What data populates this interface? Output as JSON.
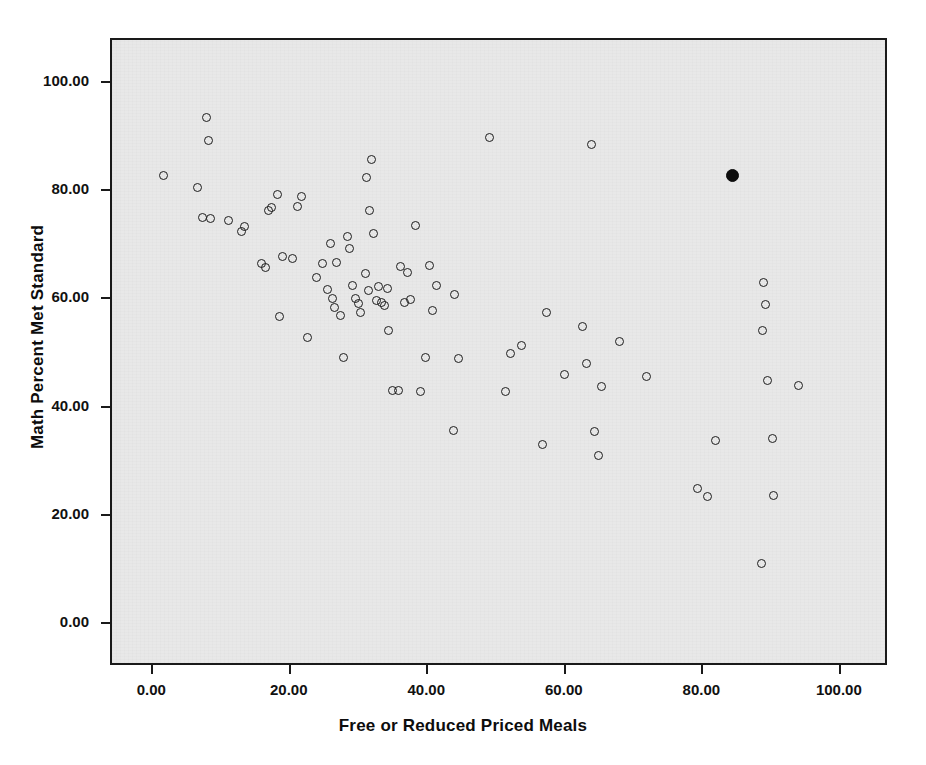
{
  "chart_data": {
    "type": "scatter",
    "title": "",
    "xlabel": "Free or Reduced Priced Meals",
    "ylabel": "Math Percent Met Standard",
    "xlim": [
      -6,
      107
    ],
    "ylim": [
      -8,
      108
    ],
    "xticks": [
      "0.00",
      "20.00",
      "40.00",
      "60.00",
      "80.00",
      "100.00"
    ],
    "xtick_values": [
      0,
      20,
      40,
      60,
      80,
      100
    ],
    "yticks": [
      "0.00",
      "20.00",
      "40.00",
      "60.00",
      "80.00",
      "100.00"
    ],
    "ytick_values": [
      0,
      20,
      40,
      60,
      80,
      100
    ],
    "grid": false,
    "legend": "none",
    "marker_style": "open-circle",
    "highlight_marker_style": "filled-circle",
    "series": [
      {
        "name": "Schools",
        "marker": "open-circle",
        "points": [
          [
            1.5,
            83.0
          ],
          [
            6.5,
            80.8
          ],
          [
            7.8,
            93.7
          ],
          [
            8.0,
            89.4
          ],
          [
            7.2,
            75.1
          ],
          [
            8.3,
            75.0
          ],
          [
            11.0,
            74.6
          ],
          [
            12.8,
            72.6
          ],
          [
            13.2,
            73.5
          ],
          [
            15.8,
            66.7
          ],
          [
            16.3,
            66.0
          ],
          [
            16.8,
            76.4
          ],
          [
            17.2,
            77.0
          ],
          [
            18.0,
            79.4
          ],
          [
            18.3,
            56.9
          ],
          [
            18.8,
            68.0
          ],
          [
            20.2,
            67.5
          ],
          [
            21.0,
            77.2
          ],
          [
            21.6,
            79.0
          ],
          [
            22.4,
            52.9
          ],
          [
            23.8,
            64.0
          ],
          [
            24.6,
            66.6
          ],
          [
            25.4,
            61.9
          ],
          [
            25.8,
            70.4
          ],
          [
            26.0,
            60.1
          ],
          [
            26.6,
            66.8
          ],
          [
            26.4,
            58.5
          ],
          [
            27.2,
            57.1
          ],
          [
            27.6,
            49.2
          ],
          [
            28.3,
            71.6
          ],
          [
            28.6,
            69.5
          ],
          [
            29.0,
            62.6
          ],
          [
            29.4,
            60.1
          ],
          [
            29.8,
            59.2
          ],
          [
            30.2,
            57.6
          ],
          [
            30.8,
            64.8
          ],
          [
            31.3,
            61.6
          ],
          [
            31.0,
            82.6
          ],
          [
            31.8,
            85.8
          ],
          [
            31.4,
            76.4
          ],
          [
            32.0,
            72.2
          ],
          [
            32.4,
            59.8
          ],
          [
            32.8,
            62.4
          ],
          [
            33.2,
            59.5
          ],
          [
            33.6,
            58.8
          ],
          [
            34.0,
            62.0
          ],
          [
            34.2,
            54.2
          ],
          [
            34.8,
            43.2
          ],
          [
            35.6,
            43.1
          ],
          [
            36.0,
            66.1
          ],
          [
            36.6,
            59.5
          ],
          [
            37.0,
            64.9
          ],
          [
            37.4,
            60.0
          ],
          [
            38.2,
            73.6
          ],
          [
            38.8,
            42.9
          ],
          [
            39.6,
            49.3
          ],
          [
            40.2,
            66.3
          ],
          [
            40.6,
            57.9
          ],
          [
            41.2,
            62.6
          ],
          [
            43.6,
            35.7
          ],
          [
            43.8,
            60.9
          ],
          [
            44.4,
            49.1
          ],
          [
            48.9,
            89.9
          ],
          [
            51.2,
            42.9
          ],
          [
            52.0,
            50.0
          ],
          [
            53.6,
            51.4
          ],
          [
            56.6,
            33.2
          ],
          [
            57.2,
            57.6
          ],
          [
            59.8,
            46.2
          ],
          [
            62.4,
            55.0
          ],
          [
            63.0,
            48.1
          ],
          [
            63.8,
            88.6
          ],
          [
            64.2,
            35.6
          ],
          [
            64.8,
            31.2
          ],
          [
            65.2,
            43.9
          ],
          [
            67.8,
            52.3
          ],
          [
            71.8,
            45.7
          ],
          [
            79.2,
            25.0
          ],
          [
            80.6,
            23.6
          ],
          [
            81.8,
            33.9
          ],
          [
            88.4,
            11.1
          ],
          [
            88.7,
            63.2
          ],
          [
            89.0,
            59.1
          ],
          [
            88.6,
            54.3
          ],
          [
            89.4,
            45.0
          ],
          [
            90.0,
            34.2
          ],
          [
            90.2,
            23.7
          ],
          [
            93.8,
            44.0
          ]
        ]
      },
      {
        "name": "Highlighted School",
        "marker": "filled-circle",
        "points": [
          [
            84.3,
            83.0
          ]
        ]
      }
    ]
  }
}
